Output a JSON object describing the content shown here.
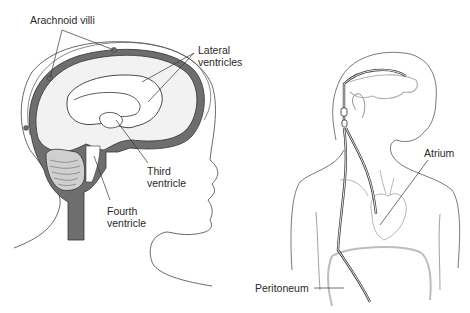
{
  "figure": {
    "left_panel": {
      "title": "Brain ventricular system (sagittal view)",
      "labels": {
        "arachnoid_villi": "Arachnoid villi",
        "lateral_ventricles": "Lateral\nventricles",
        "third_ventricle": "Third\nventricle",
        "fourth_ventricle": "Fourth\nventricle"
      }
    },
    "right_panel": {
      "title": "Ventricular shunt placement",
      "labels": {
        "atrium": "Atrium",
        "peritoneum": "Peritoneum"
      }
    },
    "colors": {
      "outline": "#333333",
      "csf_dark": "#6e6e6e",
      "brain_fill": "#f2f2f2",
      "ventricle_fill": "#ffffff",
      "light_organ": "#b5b5b5",
      "text": "#2a2a2a"
    }
  }
}
